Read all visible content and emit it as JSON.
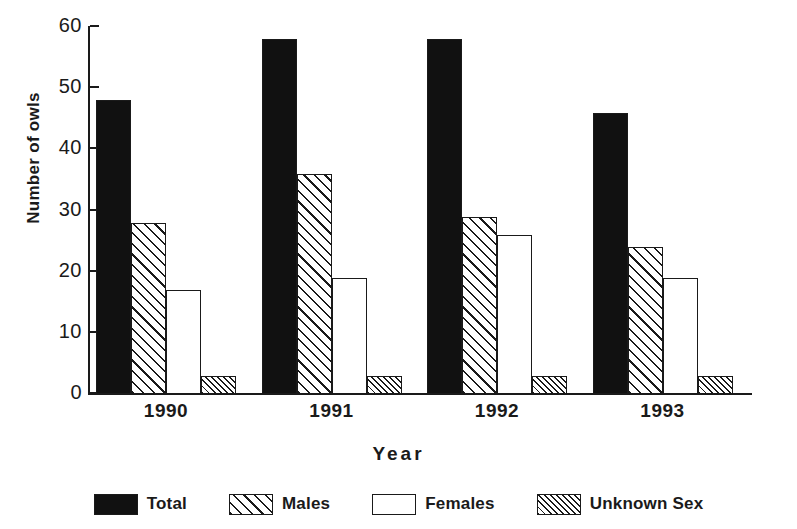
{
  "chart_data": {
    "type": "bar",
    "title": "",
    "xlabel": "Year",
    "ylabel": "Number of owls",
    "categories": [
      "1990",
      "1991",
      "1992",
      "1993"
    ],
    "series": [
      {
        "name": "Total",
        "pattern": "solid-black",
        "values": [
          48,
          58,
          58,
          46
        ]
      },
      {
        "name": "Males",
        "pattern": "wide-diagonal-hatch",
        "values": [
          28,
          36,
          29,
          24
        ]
      },
      {
        "name": "Females",
        "pattern": "white-empty",
        "values": [
          17,
          19,
          26,
          19
        ]
      },
      {
        "name": "Unknown Sex",
        "pattern": "fine-diagonal-hatch",
        "values": [
          3,
          3,
          3,
          3
        ]
      }
    ],
    "ylim": [
      0,
      60
    ],
    "yticks": [
      0,
      10,
      20,
      30,
      40,
      50,
      60
    ],
    "ytick_labels": [
      "0",
      "10",
      "20",
      "30",
      "40",
      "50",
      "60"
    ],
    "grid": false,
    "legend_position": "bottom",
    "colors": {
      "axis": "#1a1a1a",
      "text": "#1a1a1a",
      "background": "#ffffff",
      "total_fill": "#111111",
      "hatch_line": "#1a1a1a",
      "empty_fill": "#ffffff"
    }
  }
}
